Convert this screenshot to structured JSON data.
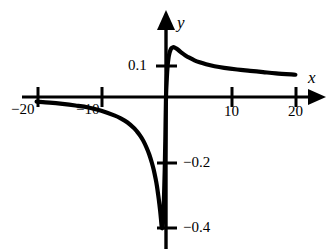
{
  "chart_data": {
    "type": "line",
    "title": "",
    "xlabel": "x",
    "ylabel": "y",
    "xlim": [
      -22,
      22
    ],
    "ylim": [
      -0.46,
      0.26
    ],
    "grid": false,
    "legend": null,
    "axis_style": "arrowed-cartesian",
    "x_ticks": [
      -20,
      -10,
      10,
      20
    ],
    "x_tick_labels": [
      "−20",
      "−10",
      "10",
      "20"
    ],
    "y_ticks": [
      0.1,
      -0.2,
      -0.4
    ],
    "y_tick_labels": [
      "0.1",
      "−0.2",
      "−0.4"
    ],
    "series": [
      {
        "name": "curve",
        "color": "#000000",
        "line_width": 4.2,
        "x": [
          -20,
          -18,
          -16,
          -14,
          -12,
          -10,
          -8,
          -7,
          -6,
          -5,
          -4.5,
          -4,
          -3.5,
          -3,
          -2.6,
          -2.2,
          -1.9,
          -1.6,
          -1.4,
          -1.2,
          -1.05,
          -0.9,
          -0.78,
          -0.7,
          -0.62,
          -0.55,
          -0.48,
          -0.4,
          -0.3,
          -0.2,
          -0.1,
          0,
          0.12,
          0.25,
          0.4,
          0.55,
          0.7,
          0.85,
          1.0,
          1.15,
          1.35,
          1.6,
          2.0,
          2.5,
          3.0,
          3.6,
          4.4,
          5.2,
          6.2,
          7.5,
          9,
          11,
          13,
          15,
          17,
          20
        ],
        "y": [
          -0.014,
          -0.017,
          -0.021,
          -0.026,
          -0.032,
          -0.042,
          -0.056,
          -0.065,
          -0.077,
          -0.094,
          -0.105,
          -0.118,
          -0.134,
          -0.155,
          -0.175,
          -0.2,
          -0.222,
          -0.25,
          -0.272,
          -0.3,
          -0.323,
          -0.348,
          -0.372,
          -0.39,
          -0.4,
          -0.398,
          -0.385,
          -0.355,
          -0.3,
          -0.225,
          -0.125,
          0.0,
          0.055,
          0.095,
          0.121,
          0.135,
          0.144,
          0.149,
          0.151,
          0.152,
          0.151,
          0.148,
          0.142,
          0.134,
          0.127,
          0.12,
          0.112,
          0.106,
          0.1,
          0.094,
          0.089,
          0.084,
          0.08,
          0.076,
          0.072,
          0.068
        ],
        "minimum": {
          "x": -0.62,
          "y": -0.4
        },
        "maximum": {
          "x": 1.15,
          "y": 0.152
        },
        "x_intercepts": [
          0
        ]
      }
    ]
  },
  "labels": {
    "axis_x": "x",
    "axis_y": "y",
    "x_neg20": "−20",
    "x_neg10": "−10",
    "x_10": "10",
    "x_20": "20",
    "y_01": "0.1",
    "y_neg02": "−0.2",
    "y_neg04": "−0.4"
  },
  "colors": {
    "background": "#ffffff",
    "axis": "#000000",
    "curve": "#000000",
    "text": "#000000"
  }
}
